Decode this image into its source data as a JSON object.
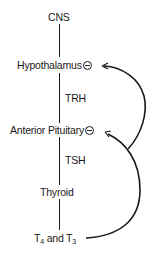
{
  "diagram": {
    "nodes": {
      "cns": "CNS",
      "hypothalamus": "Hypothalamus",
      "trh": "TRH",
      "anterior_pituitary": "Anterior Pituitary",
      "tsh": "TSH",
      "thyroid": "Thyroid",
      "t4_prefix": "T",
      "t4_sub": "4",
      "and": " and ",
      "t3_prefix": "T",
      "t3_sub": "3"
    },
    "inhibition_symbol": "minus-circle",
    "edges": [
      {
        "from": "CNS",
        "to": "Hypothalamus",
        "type": "line"
      },
      {
        "from": "Hypothalamus",
        "to": "Anterior Pituitary",
        "label": "TRH",
        "type": "line"
      },
      {
        "from": "Anterior Pituitary",
        "to": "Thyroid",
        "label": "TSH",
        "type": "line"
      },
      {
        "from": "Thyroid",
        "to": "T4 and T3",
        "type": "line"
      },
      {
        "from": "T4 and T3",
        "to": "Anterior Pituitary",
        "type": "negative-feedback-arrow"
      },
      {
        "from": "T4 and T3",
        "to": "Hypothalamus",
        "type": "negative-feedback-arrow"
      }
    ],
    "colors": {
      "ink": "#1a1a1a",
      "background": "#ffffff"
    }
  }
}
